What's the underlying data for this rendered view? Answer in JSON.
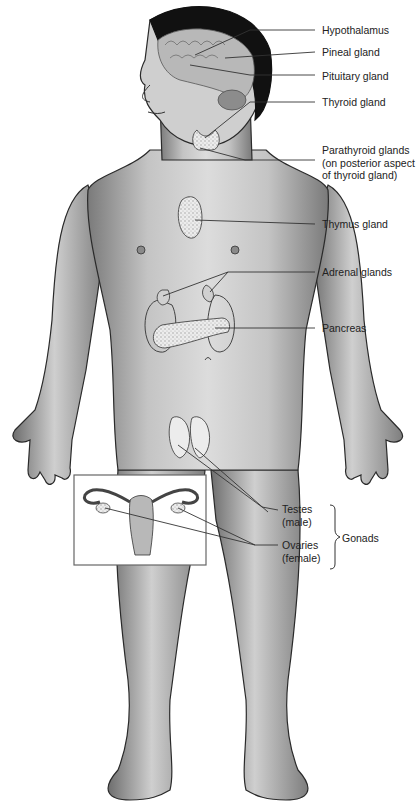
{
  "figure": {
    "colors": {
      "skin_light": "#d8d8d8",
      "skin_mid": "#a8a8a8",
      "skin_dark": "#6e6e6e",
      "outline": "#2a2a2a",
      "hair": "#111111",
      "gland_fill": "#e8e8e8",
      "leader_line": "#333333",
      "inset_border": "#666666"
    }
  },
  "labels": {
    "hypothalamus": "Hypothalamus",
    "pineal": "Pineal gland",
    "pituitary": "Pituitary gland",
    "thyroid": "Thyroid gland",
    "parathyroid": [
      "Parathyroid glands",
      "(on posterior aspect",
      "of thyroid gland)"
    ],
    "thymus": "Thymus gland",
    "adrenal": "Adrenal glands",
    "pancreas": "Pancreas",
    "testes": [
      "Testes",
      "(male)"
    ],
    "ovaries": [
      "Ovaries",
      "(female)"
    ],
    "gonads": "Gonads"
  },
  "inset": {
    "description": "Female reproductive organs showing ovaries"
  }
}
